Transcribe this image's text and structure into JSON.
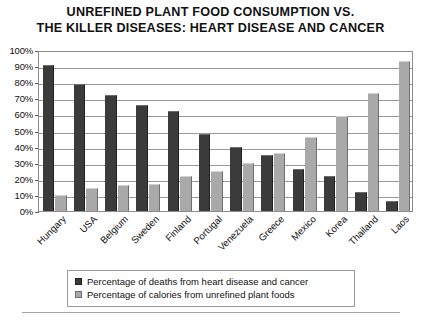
{
  "chart_data": {
    "type": "bar",
    "title": "UNREFINED PLANT FOOD CONSUMPTION VS. THE KILLER DISEASES: HEART DISEASE AND CANCER",
    "title_lines": [
      "UNREFINED PLANT FOOD CONSUMPTION VS.",
      "THE KILLER DISEASES: HEART DISEASE AND CANCER"
    ],
    "xlabel": "",
    "ylabel": "",
    "ylim": [
      0,
      100
    ],
    "ytick_step": 10,
    "grid": true,
    "legend_position": "bottom",
    "categories": [
      "Hungary",
      "USA",
      "Belgium",
      "Sweden",
      "Finland",
      "Portugal",
      "Venezuela",
      "Greece",
      "Mexico",
      "Korea",
      "Thailand",
      "Laos"
    ],
    "ytick_labels": [
      "100%",
      "90%",
      "80%",
      "70%",
      "60%",
      "50%",
      "40%",
      "30%",
      "20%",
      "10%",
      "0%"
    ],
    "ytick_values": [
      100,
      90,
      80,
      70,
      60,
      50,
      40,
      30,
      20,
      10,
      0
    ],
    "series": [
      {
        "name": "Percentage of deaths from heart disease and cancer",
        "color": "#3b3b3b",
        "values": [
          91,
          79,
          72,
          66,
          62,
          48,
          40,
          35,
          26,
          22,
          12,
          6
        ]
      },
      {
        "name": "Percentage of calories from unrefined plant foods",
        "color": "#a9a9a9",
        "values": [
          10,
          14,
          16,
          17,
          22,
          25,
          30,
          36,
          46,
          59,
          73,
          93
        ]
      }
    ]
  },
  "legend": {
    "items": [
      {
        "label": "Percentage of deaths from heart disease and cancer",
        "swatch": "dark"
      },
      {
        "label": "Percentage of calories from unrefined plant foods",
        "swatch": "light"
      }
    ]
  }
}
